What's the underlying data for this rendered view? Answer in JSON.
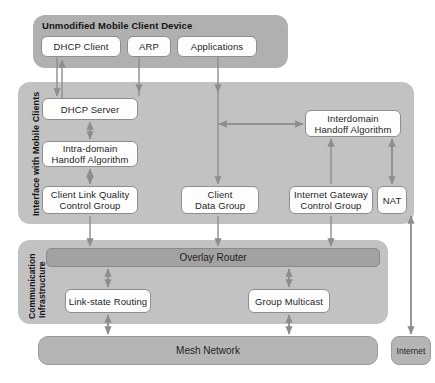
{
  "diagram": {
    "colors": {
      "panel_top": "#b0b0b0",
      "panel_mid": "#c2c2c2",
      "panel_bottom": "#c2c2c2",
      "white_box": "#fdfdfd",
      "gray_box": "#b5b5b5",
      "dark_bar": "#a2a2a2",
      "arrow": "#8d8d8d",
      "text": "#1d1d1d",
      "background": "#ffffff"
    }
  },
  "top_panel": {
    "title": "Unmodified Mobile Client Device",
    "boxes": [
      {
        "label": "DHCP Client"
      },
      {
        "label": "ARP"
      },
      {
        "label": "Applications"
      }
    ]
  },
  "middle_panel": {
    "vertical_label": "Interface with Mobile Clients",
    "boxes": [
      {
        "label": "DHCP Server"
      },
      {
        "label": "Intra-domain\nHandoff Algorithm",
        "line1": "Intra-domain",
        "line2": "Handoff Algorithm"
      },
      {
        "label": "Client Link Quality\nControl Group",
        "line1": "Client Link Quality",
        "line2": "Control Group"
      },
      {
        "label": "Client\nData Group",
        "line1": "Client",
        "line2": "Data Group"
      },
      {
        "label": "Interdomain\nHandoff Algorithm",
        "line1": "Interdomain",
        "line2": "Handoff Algorithm"
      },
      {
        "label": "Internet Gateway\nControl Group",
        "line1": "Internet Gateway",
        "line2": "Control Group"
      },
      {
        "label": "NAT"
      }
    ]
  },
  "bottom_panel": {
    "vertical_label_line1": "Communication",
    "vertical_label_line2": "Infrastructure",
    "overlay_router": "Overlay Router",
    "boxes": [
      {
        "label": "Link-state Routing"
      },
      {
        "label": "Group Multicast"
      }
    ]
  },
  "footer": {
    "mesh_network": "Mesh Network",
    "internet": "Internet"
  }
}
